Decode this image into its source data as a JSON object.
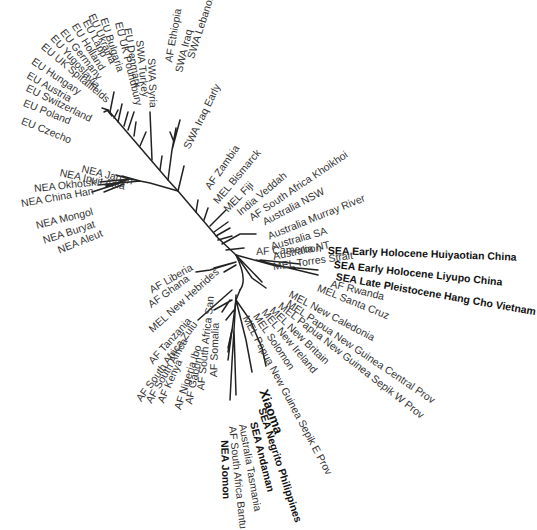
{
  "diagram": {
    "type": "unrooted-phylogenetic-tree",
    "line_color": "#222222",
    "label_color": "#333333",
    "labels": [
      {
        "text": "EU Czecho",
        "x": 22,
        "y": 120,
        "r": 22,
        "w": "n"
      },
      {
        "text": "EU Poland",
        "x": 24,
        "y": 102,
        "r": 22,
        "w": "n"
      },
      {
        "text": "EU Switzerland",
        "x": 27,
        "y": 87,
        "r": 26,
        "w": "n"
      },
      {
        "text": "EU Austria",
        "x": 28,
        "y": 74,
        "r": 30,
        "w": "n"
      },
      {
        "text": "EU Hungary",
        "x": 33,
        "y": 60,
        "r": 34,
        "w": "n"
      },
      {
        "text": "EU UK Spitalfields",
        "x": 43,
        "y": 45,
        "r": 40,
        "w": "n"
      },
      {
        "text": "EU Yugoslavia",
        "x": 53,
        "y": 36,
        "r": 48,
        "w": "n"
      },
      {
        "text": "EU Germany",
        "x": 63,
        "y": 30,
        "r": 52,
        "w": "n"
      },
      {
        "text": "EU Holland",
        "x": 75,
        "y": 24,
        "r": 58,
        "w": "n"
      },
      {
        "text": "EU Lapp",
        "x": 86,
        "y": 20,
        "r": 62,
        "w": "n"
      },
      {
        "text": "EU Ukraina",
        "x": 92,
        "y": 14,
        "r": 66,
        "w": "n"
      },
      {
        "text": "EU Bulgaria",
        "x": 104,
        "y": 18,
        "r": 72,
        "w": "n"
      },
      {
        "text": "EU UK Poundbury",
        "x": 119,
        "y": 22,
        "r": 76,
        "w": "n"
      },
      {
        "text": "EU Denmark",
        "x": 128,
        "y": 28,
        "r": 80,
        "w": "n"
      },
      {
        "text": "SWA Turkey",
        "x": 140,
        "y": 40,
        "r": 84,
        "w": "n"
      },
      {
        "text": "SWA Syria",
        "x": 152,
        "y": 58,
        "r": 88,
        "w": "n"
      },
      {
        "text": "AF Ethiopia",
        "x": 168,
        "y": 62,
        "r": -80,
        "w": "n"
      },
      {
        "text": "SWA Iraq",
        "x": 178,
        "y": 72,
        "r": -76,
        "w": "n"
      },
      {
        "text": "SWA Lebanon",
        "x": 190,
        "y": 58,
        "r": -72,
        "w": "n"
      },
      {
        "text": "SWA Iraq Early",
        "x": 186,
        "y": 148,
        "r": -64,
        "w": "n"
      },
      {
        "text": "AF Zambia",
        "x": 207,
        "y": 188,
        "r": -55,
        "w": "n"
      },
      {
        "text": "MEL Bismarck",
        "x": 215,
        "y": 202,
        "r": -50,
        "w": "n"
      },
      {
        "text": "MEL Fiji",
        "x": 225,
        "y": 210,
        "r": -46,
        "w": "n"
      },
      {
        "text": "India Veddah",
        "x": 238,
        "y": 213,
        "r": -40,
        "w": "n"
      },
      {
        "text": "AF South Africa Khoikhoi",
        "x": 250,
        "y": 218,
        "r": -34,
        "w": "n"
      },
      {
        "text": "Australia NSW",
        "x": 263,
        "y": 222,
        "r": -28,
        "w": "n"
      },
      {
        "text": "Australia Murray River",
        "x": 268,
        "y": 236,
        "r": -22,
        "w": "n"
      },
      {
        "text": "Australia SA",
        "x": 271,
        "y": 246,
        "r": -16,
        "w": "n"
      },
      {
        "text": "Australia NT",
        "x": 273,
        "y": 256,
        "r": -12,
        "w": "n"
      },
      {
        "text": "MEL Torres Strait",
        "x": 273,
        "y": 266,
        "r": -8,
        "w": "n"
      },
      {
        "text": "AF Cameroon",
        "x": 256,
        "y": 251,
        "r": -3,
        "w": "n"
      },
      {
        "text": "SEA Early Holocene Huiyaotian China",
        "x": 328,
        "y": 250,
        "r": 2,
        "w": "b"
      },
      {
        "text": "SEA Early Holocene Liyupo China",
        "x": 334,
        "y": 264,
        "r": 6,
        "w": "b"
      },
      {
        "text": "SEA Late Pleistocene Hang Cho Vietnam",
        "x": 336,
        "y": 276,
        "r": 10,
        "w": "b"
      },
      {
        "text": "AF Rwanda",
        "x": 331,
        "y": 283,
        "r": 14,
        "w": "n"
      },
      {
        "text": "MEL Santa Cruz",
        "x": 318,
        "y": 287,
        "r": 22,
        "w": "n"
      },
      {
        "text": "MEL New Caledonia",
        "x": 290,
        "y": 293,
        "r": 28,
        "w": "n"
      },
      {
        "text": "MEL Papua New Guinea Central Prov",
        "x": 288,
        "y": 302,
        "r": 34,
        "w": "n"
      },
      {
        "text": "MEL Papua New Guinea Sepik W Prov",
        "x": 280,
        "y": 304,
        "r": 38,
        "w": "n"
      },
      {
        "text": "MEL New Britain",
        "x": 272,
        "y": 308,
        "r": 44,
        "w": "n"
      },
      {
        "text": "MEL New Ireland",
        "x": 264,
        "y": 310,
        "r": 50,
        "w": "n"
      },
      {
        "text": "MEL Solomon",
        "x": 256,
        "y": 314,
        "r": 56,
        "w": "n"
      },
      {
        "text": "MEL Papua New Guinea Sepik E Prov",
        "x": 246,
        "y": 316,
        "r": 62,
        "w": "n"
      },
      {
        "text": "Xiaoma",
        "x": 263,
        "y": 390,
        "r": 70,
        "w": "xb"
      },
      {
        "text": "SEA Negrito Philippines",
        "x": 262,
        "y": 408,
        "r": 72,
        "w": "b"
      },
      {
        "text": "SEA Andaman",
        "x": 254,
        "y": 422,
        "r": 76,
        "w": "b"
      },
      {
        "text": "Australia Tasmania",
        "x": 243,
        "y": 424,
        "r": 80,
        "w": "n"
      },
      {
        "text": "AF South Africa Bantu",
        "x": 233,
        "y": 426,
        "r": 84,
        "w": "n"
      },
      {
        "text": "NEA Jomon",
        "x": 225,
        "y": 440,
        "r": 88,
        "w": "b"
      },
      {
        "text": "AF Somalia",
        "x": 213,
        "y": 377,
        "r": -88,
        "w": "n"
      },
      {
        "text": "AF South Africa San",
        "x": 200,
        "y": 390,
        "r": -84,
        "w": "n"
      },
      {
        "text": "AF Gabon",
        "x": 188,
        "y": 404,
        "r": -78,
        "w": "n"
      },
      {
        "text": "AF Nigeria Ibo",
        "x": 177,
        "y": 409,
        "r": -72,
        "w": "n"
      },
      {
        "text": "AF Kenya",
        "x": 160,
        "y": 402,
        "r": -66,
        "w": "n"
      },
      {
        "text": "AF South Africa",
        "x": 148,
        "y": 402,
        "r": -60,
        "w": "n"
      },
      {
        "text": "AF South Africa Zulu",
        "x": 138,
        "y": 400,
        "r": -54,
        "w": "n"
      },
      {
        "text": "AF Tanzania",
        "x": 150,
        "y": 362,
        "r": -48,
        "w": "n"
      },
      {
        "text": "MEL New Hebrides",
        "x": 150,
        "y": 330,
        "r": -42,
        "w": "n"
      },
      {
        "text": "AF Ghana",
        "x": 149,
        "y": 305,
        "r": -36,
        "w": "n"
      },
      {
        "text": "AF Liberia",
        "x": 150,
        "y": 290,
        "r": -30,
        "w": "n"
      },
      {
        "text": "NEA Japan",
        "x": 82,
        "y": 168,
        "r": 14,
        "w": "n"
      },
      {
        "text": "NEA Inuit Asia",
        "x": 60,
        "y": 172,
        "r": 12,
        "w": "n"
      },
      {
        "text": "NEA Okhotsk",
        "x": 34,
        "y": 188,
        "r": -6,
        "w": "n"
      },
      {
        "text": "NEA China Han",
        "x": 21,
        "y": 203,
        "r": -10,
        "w": "n"
      },
      {
        "text": "NEA Mongol",
        "x": 36,
        "y": 225,
        "r": -14,
        "w": "n"
      },
      {
        "text": "NEA Buryat",
        "x": 43,
        "y": 240,
        "r": -18,
        "w": "n"
      },
      {
        "text": "NEA Aleut",
        "x": 58,
        "y": 250,
        "r": -22,
        "w": "n"
      }
    ]
  }
}
